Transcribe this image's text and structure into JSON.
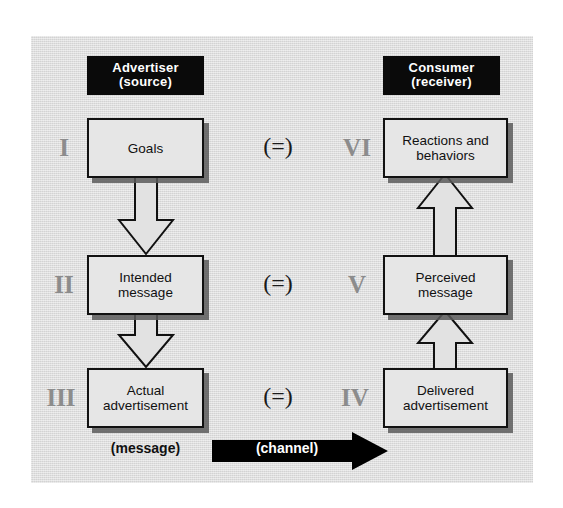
{
  "diagram": {
    "columns": {
      "left": {
        "header_line1": "Advertiser",
        "header_line2": "(source)"
      },
      "right": {
        "header_line1": "Consumer",
        "header_line2": "(receiver)"
      }
    },
    "rows": [
      {
        "left": {
          "numeral": "I",
          "line1": "Goals",
          "line2": ""
        },
        "relation": "(=)",
        "right": {
          "numeral": "VI",
          "line1": "Reactions and",
          "line2": "behaviors"
        }
      },
      {
        "left": {
          "numeral": "II",
          "line1": "Intended",
          "line2": "message"
        },
        "relation": "(=)",
        "right": {
          "numeral": "V",
          "line1": "Perceived",
          "line2": "message"
        }
      },
      {
        "left": {
          "numeral": "III",
          "line1": "Actual",
          "line2": "advertisement"
        },
        "relation": "(=)",
        "right": {
          "numeral": "IV",
          "line1": "Delivered",
          "line2": "advertisement"
        }
      }
    ],
    "footer": {
      "message_label": "(message)",
      "channel_label": "(channel)"
    },
    "colors": {
      "panel_background": "#dedede",
      "box_fill": "#e6e6e6",
      "box_border": "#111111",
      "box_shadow": "#5a5a5a",
      "header_plate": "#0a0a0a",
      "header_text": "#ffffff",
      "numeral": "#8c8c8c",
      "equals": "#1a1a1a",
      "channel_fill": "#000000",
      "page_background": "#ffffff"
    },
    "flow": {
      "left_direction": "downward",
      "right_direction": "upward",
      "channel_direction": "left-to-right"
    }
  }
}
